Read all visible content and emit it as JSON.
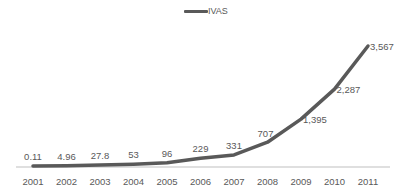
{
  "chart_data": {
    "type": "line",
    "title": "",
    "xlabel": "",
    "ylabel": "",
    "categories": [
      "2001",
      "2002",
      "2003",
      "2004",
      "2005",
      "2006",
      "2007",
      "2008",
      "2009",
      "2010",
      "2011"
    ],
    "series": [
      {
        "name": "IVAS",
        "values": [
          0.11,
          4.96,
          27.8,
          53,
          96,
          229,
          331,
          707,
          1395,
          2287,
          3567
        ],
        "data_labels": [
          "0.11",
          "4.96",
          "27.8",
          "53",
          "96",
          "229",
          "331",
          "707",
          "1,395",
          "2,287",
          "3,567"
        ],
        "color": "#595959"
      }
    ],
    "ylim": [
      0,
      3567
    ],
    "grid": false,
    "legend_position": "top",
    "y_axis_visible": false
  },
  "legend": {
    "label": "IVAS"
  },
  "colors": {
    "line": "#595959",
    "axis": "#bfbfbf",
    "text": "#595959"
  }
}
